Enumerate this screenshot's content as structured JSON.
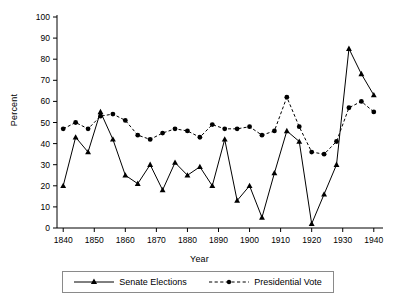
{
  "chart_data": {
    "type": "line",
    "title": "",
    "xlabel": "Year",
    "ylabel": "Percent",
    "xlim": [
      1838,
      1942
    ],
    "ylim": [
      0,
      100
    ],
    "xticks": [
      1840,
      1850,
      1860,
      1870,
      1880,
      1890,
      1900,
      1910,
      1920,
      1930,
      1940
    ],
    "yticks": [
      0,
      10,
      20,
      30,
      40,
      50,
      60,
      70,
      80,
      90,
      100
    ],
    "grid": false,
    "legend_position": "bottom-outside",
    "series": [
      {
        "name": "Senate Elections",
        "marker": "triangle",
        "linestyle": "solid",
        "color": "#000000",
        "x": [
          1840,
          1844,
          1848,
          1852,
          1856,
          1860,
          1864,
          1868,
          1872,
          1876,
          1880,
          1884,
          1888,
          1892,
          1896,
          1900,
          1904,
          1908,
          1912,
          1916,
          1920,
          1924,
          1928,
          1932,
          1936,
          1940
        ],
        "y": [
          20,
          43,
          36,
          55,
          42,
          25,
          21,
          30,
          18,
          31,
          25,
          29,
          20,
          42,
          13,
          20,
          5,
          26,
          46,
          41,
          2,
          16,
          30,
          85,
          73,
          63
        ]
      },
      {
        "name": "Presidential Vote",
        "marker": "circle",
        "linestyle": "dashed",
        "color": "#000000",
        "x": [
          1840,
          1844,
          1848,
          1852,
          1856,
          1860,
          1864,
          1868,
          1872,
          1876,
          1880,
          1884,
          1888,
          1892,
          1896,
          1900,
          1904,
          1908,
          1912,
          1916,
          1920,
          1924,
          1928,
          1932,
          1936,
          1940
        ],
        "y": [
          47,
          50,
          47,
          53,
          54,
          51,
          44,
          42,
          45,
          47,
          46,
          43,
          49,
          47,
          47,
          48,
          44,
          46,
          62,
          48,
          36,
          35,
          41,
          57,
          60,
          55
        ]
      }
    ]
  },
  "legend": {
    "items": [
      {
        "label": "Senate Elections"
      },
      {
        "label": "Presidential Vote"
      }
    ]
  }
}
